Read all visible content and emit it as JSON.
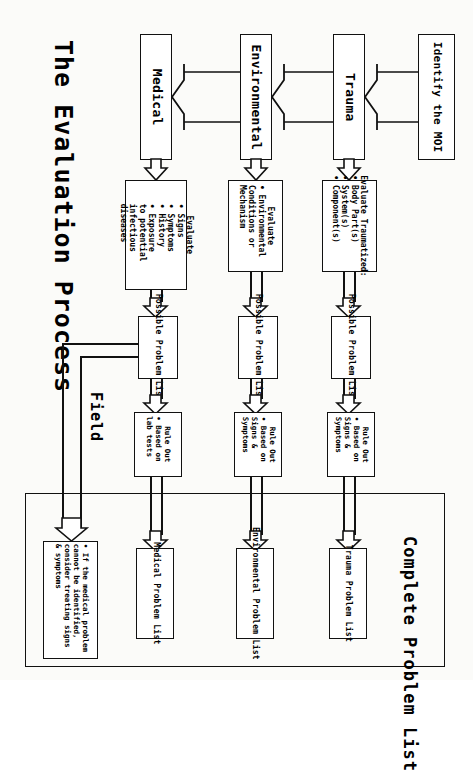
{
  "title": "The Evaluation Process",
  "field_label": "Field",
  "complete_label": "Complete Problem List",
  "source": {
    "label": "Identify the MOI"
  },
  "columns": [
    {
      "id": "trauma",
      "category": "Trauma",
      "evaluate_heading": "Evaluate Traumatized:",
      "evaluate_bullets": [
        "Body Part(s)",
        "System(s)",
        "Component(s)"
      ],
      "possible": "Possible Problem List",
      "ruleout_heading": "Rule Out",
      "ruleout_bullets": [
        "Based on Signs & Symptoms"
      ],
      "final": "Trauma Problem List"
    },
    {
      "id": "environmental",
      "category": "Environmental",
      "evaluate_heading": "Evaluate",
      "evaluate_bullets": [
        "Environmental Conditions or Mechanism"
      ],
      "possible": "Possible Problem List",
      "ruleout_heading": "Rule Out",
      "ruleout_bullets": [
        "Based on Signs & Symptoms"
      ],
      "final": "Environmental Problem List"
    },
    {
      "id": "medical",
      "category": "Medical",
      "evaluate_heading": "Evaluate",
      "evaluate_bullets": [
        "Signs",
        "Symptoms",
        "History",
        "Exposure to potential infectious diseases"
      ],
      "possible": "Possible Problem List",
      "ruleout_heading": "Rule Out",
      "ruleout_bullets": [
        "Based on lab tests"
      ],
      "final": "Medical Problem List"
    }
  ],
  "note": {
    "text": "If the medical problem cannot be identified, consider treating signs & symptoms"
  },
  "colors": {
    "stroke": "#111111",
    "fill": "#ffffff",
    "page": "#fbfbf9"
  }
}
